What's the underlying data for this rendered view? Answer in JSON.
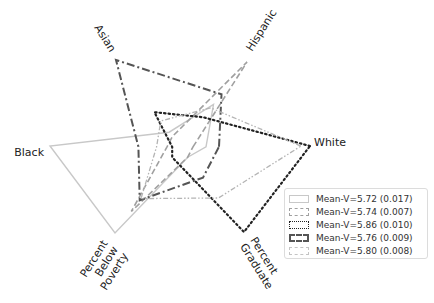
{
  "chart_data": {
    "type": "radar",
    "title": "",
    "axes": [
      "White",
      "Hispanic",
      "Asian",
      "Black",
      "Percent Below Poverty",
      "Percent Graduate"
    ],
    "axis_labels_display": [
      "White",
      "Hispanic",
      "Asian",
      "Black",
      "Percent\nBelow\nPoverty",
      "Percent\nGraduate"
    ],
    "range": [
      0,
      1
    ],
    "grid": false,
    "legend_position": "lower right",
    "series": [
      {
        "name": "Mean-V=5.72 (0.017)",
        "style": "solid",
        "color": "#c8c8c8",
        "values": [
          0.2,
          0.5,
          0.17,
          1.0,
          1.0,
          0.12
        ]
      },
      {
        "name": "Mean-V=5.74 (0.007)",
        "style": "dashed",
        "color": "#a0a0a0",
        "values": [
          0.1,
          1.0,
          0.12,
          0.1,
          0.75,
          0.12
        ]
      },
      {
        "name": "Mean-V=5.86 (0.010)",
        "style": "dotted",
        "color": "#222222",
        "values": [
          1.0,
          0.35,
          0.4,
          0.06,
          0.12,
          1.0
        ]
      },
      {
        "name": "Mean-V=5.76 (0.009)",
        "style": "dashdot",
        "color": "#555555",
        "values": [
          0.3,
          0.62,
          1.0,
          0.32,
          0.62,
          0.36
        ]
      },
      {
        "name": "Mean-V=5.80 (0.008)",
        "style": "dashdotdot",
        "color": "#b4b4b4",
        "values": [
          0.93,
          0.46,
          0.3,
          0.18,
          0.6,
          0.6
        ]
      }
    ]
  },
  "legend": {
    "items": [
      {
        "label": "Mean-V=5.72 (0.017)"
      },
      {
        "label": "Mean-V=5.74 (0.007)"
      },
      {
        "label": "Mean-V=5.86 (0.010)"
      },
      {
        "label": "Mean-V=5.76 (0.009)"
      },
      {
        "label": "Mean-V=5.80 (0.008)"
      }
    ]
  }
}
